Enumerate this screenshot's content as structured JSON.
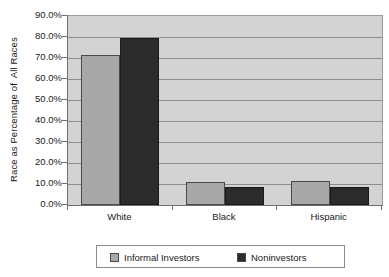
{
  "chart_data": {
    "type": "bar",
    "title": "",
    "xlabel": "",
    "ylabel": "Race as Percentage of  All Races",
    "categories": [
      "White",
      "Black",
      "Hispanic"
    ],
    "series": [
      {
        "name": "Informal Investors",
        "color": "#a8a8a8",
        "values": [
          71.3,
          11.0,
          11.3
        ]
      },
      {
        "name": "Noninvestors",
        "color": "#2b2b2b",
        "values": [
          79.5,
          8.5,
          8.4
        ]
      }
    ],
    "ylim": [
      0,
      90
    ],
    "ytick_step": 10,
    "ytick_labels": [
      "90.0%",
      "80.0%",
      "70.0%",
      "60.0%",
      "50.0%",
      "40.0%",
      "30.0%",
      "20.0%",
      "10.0%",
      "0.0%"
    ],
    "ytick_values": [
      90,
      80,
      70,
      60,
      50,
      40,
      30,
      20,
      10,
      0
    ],
    "grid": true,
    "grid_axis": "y",
    "legend_position": "bottom",
    "plot_background": "#d3d3d3",
    "figure_background": "#ffffff"
  },
  "legend": {
    "entries": [
      {
        "label": "Informal Investors"
      },
      {
        "label": "Noninvestors"
      }
    ]
  }
}
